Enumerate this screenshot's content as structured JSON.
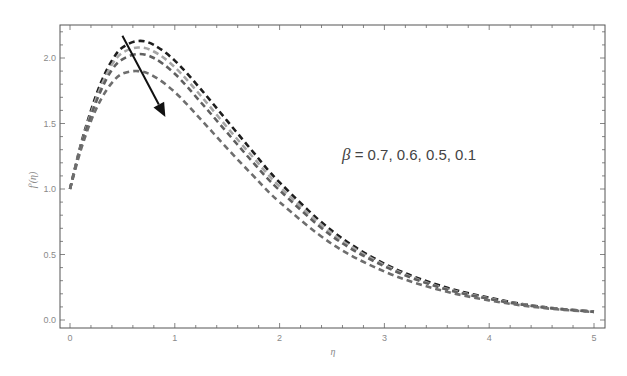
{
  "chart_data": {
    "type": "line",
    "title": "",
    "xlabel": "η",
    "ylabel": "f′(η)",
    "xlim": [
      0,
      5
    ],
    "ylim": [
      0,
      2.2
    ],
    "xticks": [
      0,
      1,
      2,
      3,
      4,
      5
    ],
    "xtick_labels": [
      "0",
      "1",
      "2",
      "3",
      "4",
      "5"
    ],
    "yticks": [
      0.0,
      0.5,
      1.0,
      1.5,
      2.0
    ],
    "ytick_labels": [
      "0.0",
      "0.5",
      "1.0",
      "1.5",
      "2.0"
    ],
    "grid": false,
    "annotation": {
      "text_symbol": "β",
      "text": " = 0.7, 0.6, 0.5, 0.1",
      "arrow_from": [
        0.5,
        2.17
      ],
      "arrow_to": [
        0.91,
        1.55
      ]
    },
    "series": [
      {
        "name": "β = 0.7",
        "color": "#1e1e1e",
        "x": [
          0,
          0.1,
          0.2,
          0.3,
          0.4,
          0.5,
          0.65,
          0.8,
          1.0,
          1.25,
          1.5,
          1.75,
          2.0,
          2.5,
          3.0,
          3.5,
          4.0,
          4.5,
          5.0
        ],
        "y": [
          1.0,
          1.33,
          1.6,
          1.82,
          1.98,
          2.08,
          2.13,
          2.1,
          1.98,
          1.76,
          1.52,
          1.28,
          1.05,
          0.68,
          0.43,
          0.27,
          0.17,
          0.1,
          0.065
        ]
      },
      {
        "name": "β = 0.6",
        "color": "#a6a6a6",
        "x": [
          0,
          0.1,
          0.2,
          0.3,
          0.4,
          0.5,
          0.65,
          0.8,
          1.0,
          1.25,
          1.5,
          1.75,
          2.0,
          2.5,
          3.0,
          3.5,
          4.0,
          4.5,
          5.0
        ],
        "y": [
          1.0,
          1.32,
          1.58,
          1.79,
          1.95,
          2.04,
          2.08,
          2.05,
          1.93,
          1.71,
          1.47,
          1.24,
          1.02,
          0.66,
          0.42,
          0.26,
          0.165,
          0.1,
          0.063
        ]
      },
      {
        "name": "β = 0.5",
        "color": "#606060",
        "x": [
          0,
          0.1,
          0.2,
          0.3,
          0.4,
          0.5,
          0.65,
          0.8,
          1.0,
          1.25,
          1.5,
          1.75,
          2.0,
          2.5,
          3.0,
          3.5,
          4.0,
          4.5,
          5.0
        ],
        "y": [
          1.0,
          1.31,
          1.56,
          1.76,
          1.91,
          1.99,
          2.03,
          2.0,
          1.88,
          1.66,
          1.43,
          1.2,
          0.99,
          0.64,
          0.41,
          0.255,
          0.16,
          0.098,
          0.062
        ]
      },
      {
        "name": "β = 0.1",
        "color": "#6e6e6e",
        "x": [
          0,
          0.1,
          0.2,
          0.3,
          0.4,
          0.5,
          0.65,
          0.8,
          1.0,
          1.25,
          1.5,
          1.75,
          2.0,
          2.5,
          3.0,
          3.5,
          4.0,
          4.5,
          5.0
        ],
        "y": [
          1.0,
          1.29,
          1.52,
          1.69,
          1.81,
          1.88,
          1.9,
          1.86,
          1.74,
          1.53,
          1.31,
          1.1,
          0.9,
          0.58,
          0.37,
          0.235,
          0.15,
          0.093,
          0.06
        ]
      }
    ]
  }
}
